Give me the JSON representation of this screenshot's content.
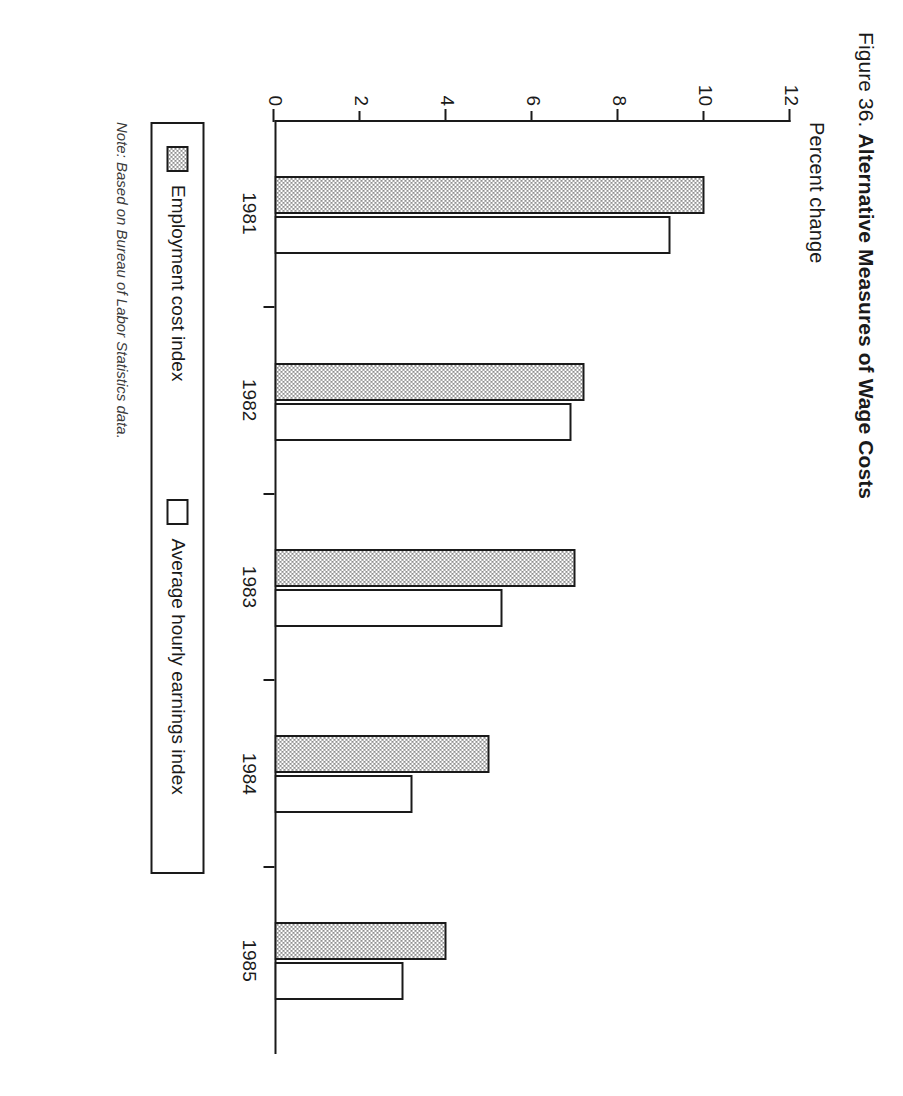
{
  "figure": {
    "number": "Figure 36.",
    "title": "Alternative Measures of Wage Costs",
    "axis_title": "Percent change",
    "note": "Note: Based on Bureau of Labor Statistics data."
  },
  "legend": {
    "items": [
      {
        "label": "Employment cost index",
        "swatch": "shaded-swatch"
      },
      {
        "label": "Average hourly earnings index",
        "swatch": "white-swatch"
      }
    ]
  },
  "axis": {
    "y_ticks": [
      "12",
      "10",
      "8",
      "6",
      "4",
      "2",
      "0"
    ],
    "x_ticks": [
      "1981",
      "1982",
      "1983",
      "1984",
      "1985"
    ]
  },
  "chart_data": {
    "type": "bar",
    "title": "Alternative Measures of Wage Costs",
    "xlabel": "",
    "ylabel": "Percent change",
    "ylim": [
      0,
      12
    ],
    "yticks": [
      0,
      2,
      4,
      6,
      8,
      10,
      12
    ],
    "grid": false,
    "legend_position": "below-plot",
    "categories": [
      "1981",
      "1982",
      "1983",
      "1984",
      "1985"
    ],
    "series": [
      {
        "name": "Employment cost index",
        "values": [
          10.0,
          7.2,
          7.0,
          5.0,
          4.0
        ]
      },
      {
        "name": "Average hourly earnings index",
        "values": [
          9.2,
          6.9,
          5.3,
          3.2,
          3.0
        ]
      }
    ]
  },
  "colors": {
    "ink": "#1a1a1a",
    "shaded_fill": "#8f8f8f",
    "plain_fill": "#ffffff",
    "page": "#ffffff"
  }
}
